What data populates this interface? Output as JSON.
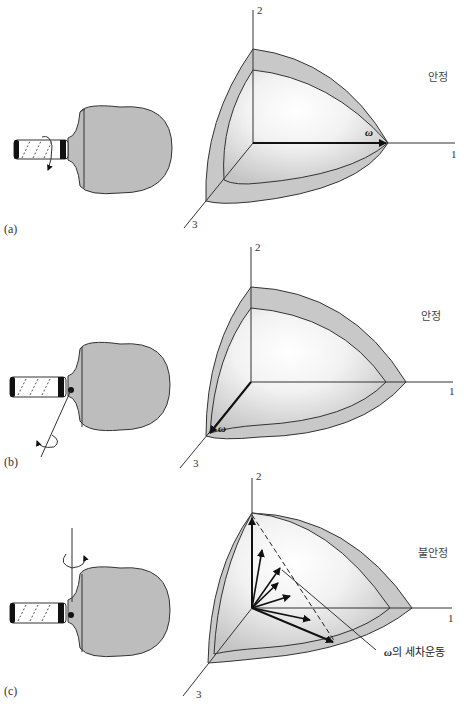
{
  "figure": {
    "panels": [
      {
        "id": "a",
        "label": "(a)",
        "state": "안정",
        "axes": {
          "x": "1",
          "y": "2",
          "z": "3"
        },
        "omega_label": "ω",
        "omega_direction": "axis 1",
        "paddle_rotation": "about handle axis"
      },
      {
        "id": "b",
        "label": "(b)",
        "state": "안정",
        "axes": {
          "x": "1",
          "y": "2",
          "z": "3"
        },
        "omega_label": "ω",
        "omega_direction": "axis 3",
        "paddle_rotation": "about axis perpendicular to paddle face"
      },
      {
        "id": "c",
        "label": "(c)",
        "state": "불안정",
        "axes": {
          "x": "1",
          "y": "2",
          "z": "3"
        },
        "omega_label": "ω",
        "omega_direction": "axis 2 (precessing)",
        "precession_label_symbol": "ω",
        "precession_label_text": "의 세차운동",
        "paddle_rotation": "about vertical axis in paddle plane"
      }
    ],
    "colors": {
      "fill_gray": "#c8c8c8",
      "paddle_gray": "#bdbdbd",
      "line": "#333333",
      "highlight": "#ffffff"
    }
  }
}
